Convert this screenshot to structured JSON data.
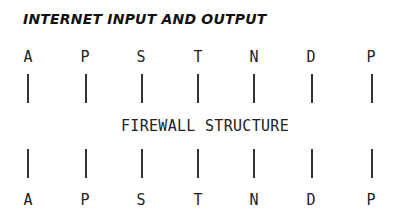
{
  "title": "INTERNET INPUT AND OUTPUT",
  "top_row": [
    "A",
    "P",
    "S",
    "T",
    "N",
    "D",
    "P"
  ],
  "center_label": "FIREWALL STRUCTURE",
  "bottom_row": [
    "A",
    "P",
    "S",
    "T",
    "N",
    "D",
    "P"
  ]
}
